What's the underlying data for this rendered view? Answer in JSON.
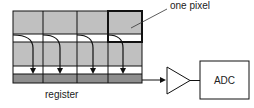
{
  "diagram": {
    "labels": {
      "pixel": "one pixel",
      "register": "register",
      "adc": "ADC"
    },
    "grid": {
      "columns": 4,
      "pixel_rows": 2,
      "has_register_row": true
    },
    "colors": {
      "pixel_fill": "#c0c0c0",
      "register_fill": "#8e8e8e",
      "channel_fill": "#ffffff",
      "stroke": "#111111"
    },
    "components": [
      "pixel-array",
      "serial-register",
      "amplifier",
      "adc"
    ]
  }
}
